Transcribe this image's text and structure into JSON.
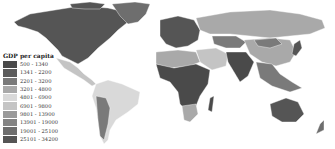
{
  "map": {
    "title": "GDP per capita",
    "legend": {
      "title": "GDP per capita",
      "items": [
        {
          "label": "500 - 1340",
          "color": "#4a4a4a"
        },
        {
          "label": "1341 - 2200",
          "color": "#5c5c5c"
        },
        {
          "label": "2201 - 3200",
          "color": "#7a7a7a"
        },
        {
          "label": "3201 - 4800",
          "color": "#a9a9a9"
        },
        {
          "label": "4801 - 6900",
          "color": "#d9d9d9"
        },
        {
          "label": "6901 - 9800",
          "color": "#c4c4c4"
        },
        {
          "label": "9801 - 13900",
          "color": "#9a9a9a"
        },
        {
          "label": "13901 - 19000",
          "color": "#848484"
        },
        {
          "label": "19001 - 25100",
          "color": "#6e6e6e"
        },
        {
          "label": "25101 - 34200",
          "color": "#555555"
        }
      ]
    },
    "regions": {
      "north_america": "#555555",
      "greenland": "#6e6e6e",
      "central_america": "#c4c4c4",
      "south_america": "#d9d9d9",
      "south_america_west": "#7a7a7a",
      "europe": "#555555",
      "russia": "#a9a9a9",
      "central_asia": "#7a7a7a",
      "china": "#a9a9a9",
      "south_asia": "#4a4a4a",
      "middle_east": "#c4c4c4",
      "north_africa": "#a9a9a9",
      "sub_saharan_africa": "#4a4a4a",
      "southern_africa": "#a9a9a9",
      "southeast_asia": "#7a7a7a",
      "australia": "#555555",
      "new_zealand": "#6e6e6e",
      "japan": "#555555"
    }
  }
}
